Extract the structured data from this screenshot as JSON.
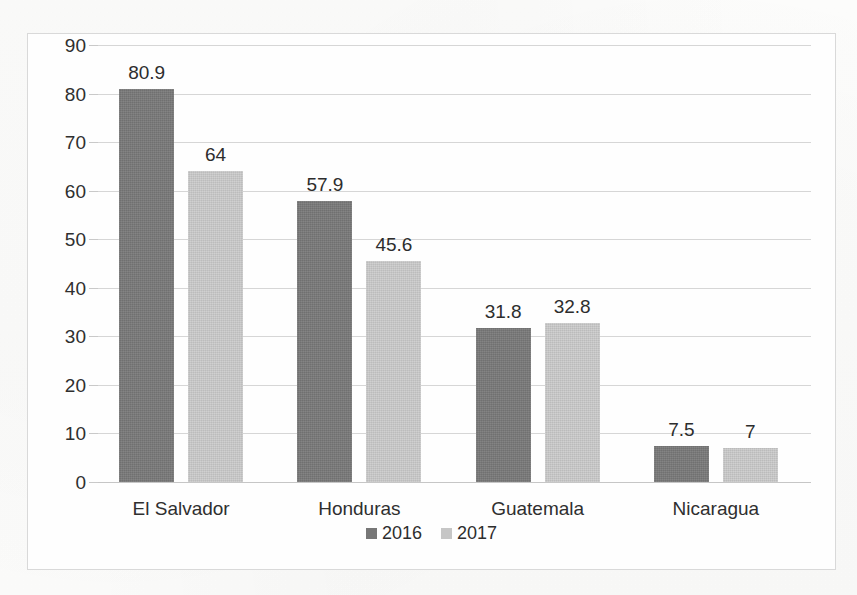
{
  "chart_data": {
    "type": "bar",
    "title": "",
    "subtitle": "",
    "xlabel": "",
    "ylabel": "",
    "categories": [
      "El Salvador",
      "Honduras",
      "Guatemala",
      "Nicaragua"
    ],
    "series": [
      {
        "name": "2016",
        "color": "#777777",
        "values": [
          80.9,
          57.9,
          31.8,
          7.5
        ],
        "labels": [
          "80.9",
          "57.9",
          "31.8",
          "7.5"
        ]
      },
      {
        "name": "2017",
        "color": "#c6c6c6",
        "values": [
          64,
          45.6,
          32.8,
          7
        ],
        "labels": [
          "64",
          "45.6",
          "32.8",
          "7"
        ]
      }
    ],
    "ylim": [
      0,
      90
    ],
    "ytick_step": 10,
    "yticks": [
      0,
      10,
      20,
      30,
      40,
      50,
      60,
      70,
      80,
      90
    ],
    "ytick_labels": [
      "0",
      "10",
      "20",
      "30",
      "40",
      "50",
      "60",
      "70",
      "80",
      "90"
    ],
    "grid": true,
    "grid_axis": "y",
    "grid_color": "#d6d6d6",
    "legend_position": "bottom",
    "legend_entries": [
      "2016",
      "2017"
    ],
    "plot_background": "#fefefe",
    "frame_border_color": "#d9d9d9"
  }
}
